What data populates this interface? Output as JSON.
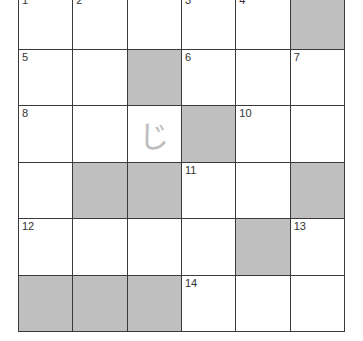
{
  "puzzle": {
    "type": "crossword",
    "rows": 6,
    "cols": 6,
    "colors": {
      "line": "#3a3a3a",
      "shaded": "#bfbfbf",
      "blank": "#ffffff",
      "number": "#333333",
      "entry": "#bdbdbd"
    },
    "cells": [
      [
        {
          "num": "1"
        },
        {
          "num": "2"
        },
        {},
        {
          "num": "3"
        },
        {
          "num": "4"
        },
        {
          "shaded": true
        }
      ],
      [
        {
          "num": "5"
        },
        {},
        {
          "shaded": true
        },
        {
          "num": "6"
        },
        {},
        {
          "num": "7"
        }
      ],
      [
        {
          "num": "8"
        },
        {},
        {
          "entry": "じ"
        },
        {
          "shaded": true
        },
        {
          "num": "10"
        },
        {}
      ],
      [
        {},
        {
          "shaded": true
        },
        {
          "shaded": true
        },
        {
          "num": "11"
        },
        {},
        {
          "shaded": true
        }
      ],
      [
        {
          "num": "12"
        },
        {},
        {},
        {},
        {
          "shaded": true
        },
        {
          "num": "13"
        }
      ],
      [
        {
          "shaded": true
        },
        {
          "shaded": true
        },
        {
          "shaded": true
        },
        {
          "num": "14"
        },
        {},
        {}
      ]
    ]
  }
}
